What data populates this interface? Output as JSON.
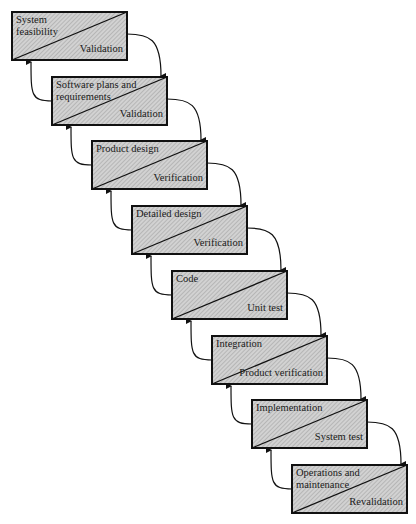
{
  "diagram": {
    "type": "waterfall",
    "stages": [
      {
        "title": "System feasibility",
        "title_lines": [
          "System",
          "feasibility"
        ],
        "check": "Validation"
      },
      {
        "title": "Software plans and requirements",
        "title_lines": [
          "Software plans and",
          "requirements"
        ],
        "check": "Validation"
      },
      {
        "title": "Product design",
        "title_lines": [
          "Product design"
        ],
        "check": "Verification"
      },
      {
        "title": "Detailed design",
        "title_lines": [
          "Detailed design"
        ],
        "check": "Verification"
      },
      {
        "title": "Code",
        "title_lines": [
          "Code"
        ],
        "check": "Unit test"
      },
      {
        "title": "Integration",
        "title_lines": [
          "Integration"
        ],
        "check": "Product verification"
      },
      {
        "title": "Implementation",
        "title_lines": [
          "Implementation"
        ],
        "check": "System test"
      },
      {
        "title": "Operations and maintenance",
        "title_lines": [
          "Operations and",
          "maintenance"
        ],
        "check": "Revalidation"
      }
    ],
    "colors": {
      "box_fill": "#c8c8c8",
      "stroke": "#111111"
    }
  }
}
